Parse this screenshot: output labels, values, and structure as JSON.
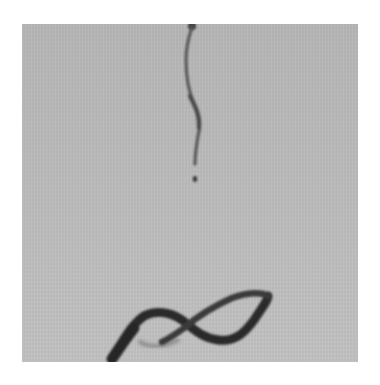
{
  "image": {
    "description": "Grayscale photograph of a viscous liquid thread falling vertically and coiling into a loop on a surface",
    "alt": "Falling liquid thread with a detached droplet and a coiled figure-eight shaped pile at the bottom",
    "colors": {
      "page_background": "#ffffff",
      "photo_background": "#b9b9b9",
      "thread": "#4a4a4a",
      "coil": "#2c2c2c",
      "coil_faint": "#8a8a8a"
    },
    "elements": {
      "thread": "vertical wavy liquid thread",
      "droplet": "small detached droplet",
      "coil": "dark coiled loop of liquid on the surface"
    }
  }
}
